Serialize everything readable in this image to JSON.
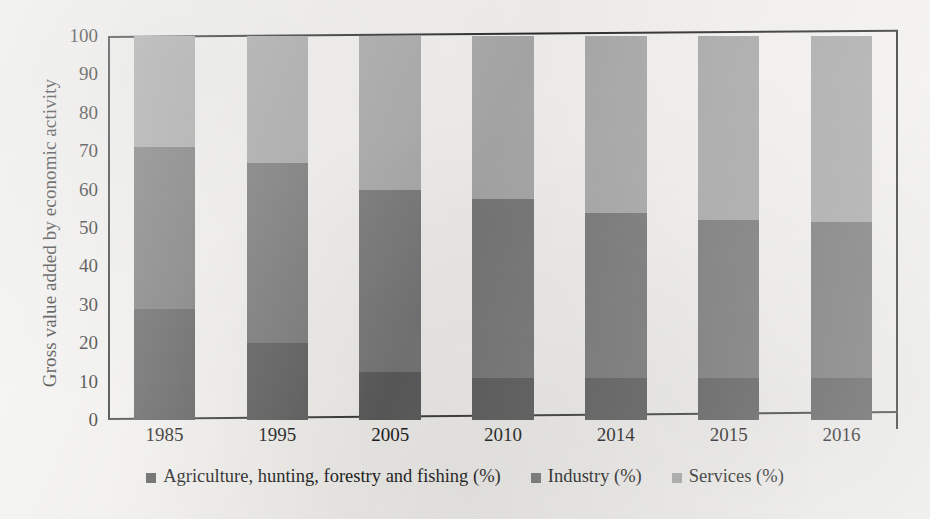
{
  "chart_data": {
    "type": "bar",
    "subtype": "stacked-100-percent",
    "title": "",
    "xlabel": "",
    "ylabel": "Gross value added by economic activity",
    "categories": [
      "1985",
      "1995",
      "2005",
      "2010",
      "2014",
      "2015",
      "2016"
    ],
    "series": [
      {
        "name": "Agriculture, hunting, forestry and fishing (%)",
        "color": "#5c5c5c",
        "values": [
          29,
          20,
          12.5,
          11,
          11,
          11,
          11
        ]
      },
      {
        "name": "Industry (%)",
        "color": "#777777",
        "values": [
          42,
          47,
          47.5,
          46.5,
          43,
          41,
          40.5
        ]
      },
      {
        "name": "Services (%)",
        "color": "#a8a8a8",
        "values": [
          29,
          33,
          40,
          42.5,
          46,
          48,
          48.5
        ]
      }
    ],
    "ylim": [
      0,
      100
    ],
    "ytick_values": [
      0,
      10,
      20,
      30,
      40,
      50,
      60,
      70,
      80,
      90,
      100
    ],
    "ytick_labels": [
      "0",
      "10",
      "20",
      "30",
      "40",
      "50",
      "60",
      "70",
      "80",
      "90",
      "100"
    ],
    "grid": false,
    "legend_position": "bottom"
  },
  "axis": {
    "y_title": "Gross value added by economic activity",
    "y_ticks": [
      "100",
      "90",
      "80",
      "70",
      "60",
      "50",
      "40",
      "30",
      "20",
      "10",
      "0"
    ],
    "x_ticks": [
      "1985",
      "1995",
      "2005",
      "2010",
      "2014",
      "2015",
      "2016"
    ]
  },
  "legend": {
    "items": [
      {
        "label": "Agriculture, hunting, forestry and fishing (%)",
        "color": "#5c5c5c"
      },
      {
        "label": "Industry (%)",
        "color": "#777777"
      },
      {
        "label": "Services (%)",
        "color": "#a8a8a8"
      }
    ]
  }
}
